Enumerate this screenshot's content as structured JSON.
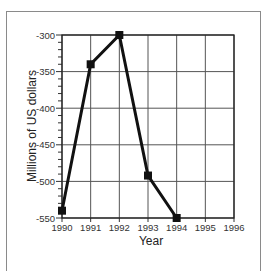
{
  "chart_data": {
    "type": "line",
    "title": "",
    "xlabel": "Year",
    "ylabel": "Millions of US dollars",
    "x": [
      1990,
      1991,
      1992,
      1993,
      1994
    ],
    "series": [
      {
        "name": "",
        "values": [
          -540,
          -340,
          -300,
          -492,
          -550
        ],
        "color": "#111111",
        "marker": "square"
      }
    ],
    "x_ticks": [
      "1990",
      "1991",
      "1992",
      "1993",
      "1994",
      "1995",
      "1996"
    ],
    "y_ticks": [
      "-300",
      "-350",
      "-400",
      "-450",
      "-500",
      "-550"
    ],
    "xlim": [
      1990,
      1996
    ],
    "ylim": [
      -550,
      -300
    ],
    "grid": true,
    "legend": "none"
  }
}
